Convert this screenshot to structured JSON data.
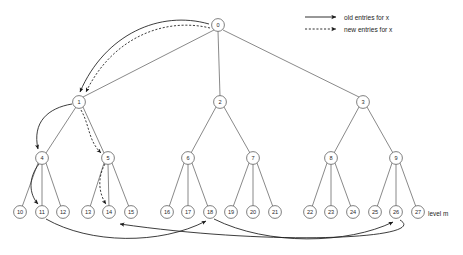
{
  "diagram": {
    "level_label": "level m",
    "legend": {
      "items": [
        {
          "label": "old entries for x",
          "style": "solid",
          "icon": "arrow-right-icon"
        },
        {
          "label": "new entries for x",
          "style": "dashed",
          "icon": "arrow-right-dashed-icon"
        }
      ]
    },
    "colors": {
      "node_stroke": "#5f5f5f",
      "node_fill": "#ffffff",
      "tree_edge": "#6b6b6b",
      "pointer": "#1a1a1a",
      "text": "#1d1d1d",
      "background": "#ffffff"
    },
    "nodes": [
      {
        "id": "0",
        "label": "0",
        "x": 218,
        "y": 25,
        "level": 0
      },
      {
        "id": "1",
        "label": "1",
        "x": 79,
        "y": 102,
        "level": 1
      },
      {
        "id": "2",
        "label": "2",
        "x": 220,
        "y": 102,
        "level": 1
      },
      {
        "id": "3",
        "label": "3",
        "x": 363,
        "y": 102,
        "level": 1
      },
      {
        "id": "4",
        "label": "4",
        "x": 42,
        "y": 158,
        "level": 2
      },
      {
        "id": "5",
        "label": "5",
        "x": 108,
        "y": 158,
        "level": 2
      },
      {
        "id": "6",
        "label": "6",
        "x": 188,
        "y": 158,
        "level": 2
      },
      {
        "id": "7",
        "label": "7",
        "x": 253,
        "y": 158,
        "level": 2
      },
      {
        "id": "8",
        "label": "8",
        "x": 331,
        "y": 158,
        "level": 2
      },
      {
        "id": "9",
        "label": "9",
        "x": 396,
        "y": 158,
        "level": 2
      },
      {
        "id": "10",
        "label": "10",
        "x": 20,
        "y": 212,
        "level": 3
      },
      {
        "id": "11",
        "label": "11",
        "x": 42,
        "y": 212,
        "level": 3
      },
      {
        "id": "12",
        "label": "12",
        "x": 63,
        "y": 212,
        "level": 3
      },
      {
        "id": "13",
        "label": "13",
        "x": 88,
        "y": 212,
        "level": 3
      },
      {
        "id": "14",
        "label": "14",
        "x": 109,
        "y": 212,
        "level": 3
      },
      {
        "id": "15",
        "label": "15",
        "x": 131,
        "y": 212,
        "level": 3
      },
      {
        "id": "16",
        "label": "16",
        "x": 167,
        "y": 212,
        "level": 3
      },
      {
        "id": "17",
        "label": "17",
        "x": 188,
        "y": 212,
        "level": 3
      },
      {
        "id": "18",
        "label": "18",
        "x": 210,
        "y": 212,
        "level": 3
      },
      {
        "id": "19",
        "label": "19",
        "x": 231,
        "y": 212,
        "level": 3
      },
      {
        "id": "20",
        "label": "20",
        "x": 253,
        "y": 212,
        "level": 3
      },
      {
        "id": "21",
        "label": "21",
        "x": 275,
        "y": 212,
        "level": 3
      },
      {
        "id": "22",
        "label": "22",
        "x": 310,
        "y": 212,
        "level": 3
      },
      {
        "id": "23",
        "label": "23",
        "x": 331,
        "y": 212,
        "level": 3
      },
      {
        "id": "24",
        "label": "24",
        "x": 353,
        "y": 212,
        "level": 3
      },
      {
        "id": "25",
        "label": "25",
        "x": 375,
        "y": 212,
        "level": 3
      },
      {
        "id": "26",
        "label": "26",
        "x": 396,
        "y": 212,
        "level": 3
      },
      {
        "id": "27",
        "label": "27",
        "x": 418,
        "y": 212,
        "level": 3
      }
    ],
    "tree_edges": [
      {
        "from": "0",
        "to": "1"
      },
      {
        "from": "0",
        "to": "2"
      },
      {
        "from": "0",
        "to": "3"
      },
      {
        "from": "1",
        "to": "4"
      },
      {
        "from": "1",
        "to": "5"
      },
      {
        "from": "2",
        "to": "6"
      },
      {
        "from": "2",
        "to": "7"
      },
      {
        "from": "3",
        "to": "8"
      },
      {
        "from": "3",
        "to": "9"
      },
      {
        "from": "4",
        "to": "10"
      },
      {
        "from": "4",
        "to": "11"
      },
      {
        "from": "4",
        "to": "12"
      },
      {
        "from": "5",
        "to": "13"
      },
      {
        "from": "5",
        "to": "14"
      },
      {
        "from": "5",
        "to": "15"
      },
      {
        "from": "6",
        "to": "16"
      },
      {
        "from": "6",
        "to": "17"
      },
      {
        "from": "6",
        "to": "18"
      },
      {
        "from": "7",
        "to": "19"
      },
      {
        "from": "7",
        "to": "20"
      },
      {
        "from": "7",
        "to": "21"
      },
      {
        "from": "8",
        "to": "22"
      },
      {
        "from": "8",
        "to": "23"
      },
      {
        "from": "8",
        "to": "24"
      },
      {
        "from": "9",
        "to": "25"
      },
      {
        "from": "9",
        "to": "26"
      },
      {
        "from": "9",
        "to": "27"
      }
    ],
    "pointers": [
      {
        "name": "pointer-0-to-1-old",
        "style": "solid",
        "from": "0",
        "to": "1"
      },
      {
        "name": "pointer-0-to-1-new",
        "style": "dashed",
        "from": "0",
        "to": "1"
      },
      {
        "name": "pointer-1-to-4-old",
        "style": "solid",
        "from": "1",
        "to": "4"
      },
      {
        "name": "pointer-1-to-5-new",
        "style": "dashed",
        "from": "1",
        "to": "5"
      },
      {
        "name": "pointer-4-to-11-old",
        "style": "solid",
        "from": "4",
        "to": "11"
      },
      {
        "name": "pointer-5-to-14-new",
        "style": "dashed",
        "from": "5",
        "to": "14"
      },
      {
        "name": "pointer-11-to-18-old",
        "style": "solid",
        "from": "11",
        "to": "18"
      },
      {
        "name": "pointer-18-to-26-old",
        "style": "solid",
        "from": "18",
        "to": "26"
      },
      {
        "name": "pointer-26-to-14-old",
        "style": "solid",
        "from": "26",
        "to": "14"
      }
    ]
  }
}
